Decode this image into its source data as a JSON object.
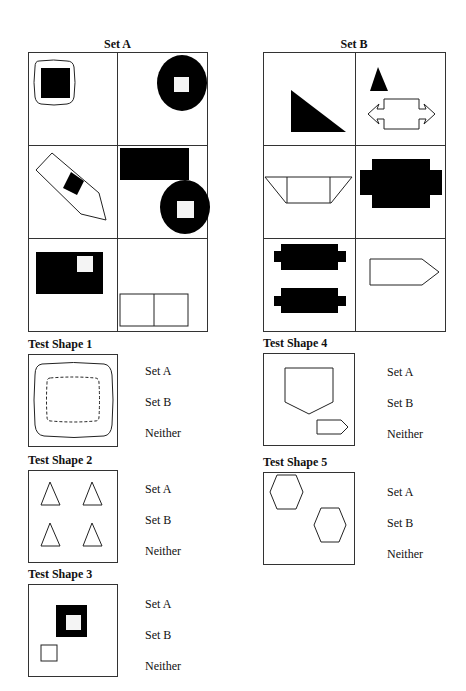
{
  "set_a": {
    "title": "Set A",
    "cells": [
      {
        "id": "a1",
        "desc": "black square inside rounded rectangle"
      },
      {
        "id": "a2",
        "desc": "black circle with white square"
      },
      {
        "id": "a3",
        "desc": "tilted pentagon with black diamond"
      },
      {
        "id": "a4",
        "desc": "black rectangle and black circle with white square"
      },
      {
        "id": "a5",
        "desc": "black rectangle with white square"
      },
      {
        "id": "a6",
        "desc": "two adjacent outlined squares"
      }
    ]
  },
  "set_b": {
    "title": "Set B",
    "cells": [
      {
        "id": "b1",
        "desc": "black right triangle"
      },
      {
        "id": "b2",
        "desc": "black triangle and outlined double arrow"
      },
      {
        "id": "b3",
        "desc": "outlined trapezoid"
      },
      {
        "id": "b4",
        "desc": "black stepped cross shape"
      },
      {
        "id": "b5",
        "desc": "two black stepped bars"
      },
      {
        "id": "b6",
        "desc": "outlined pentagon arrow"
      }
    ]
  },
  "tests": [
    {
      "label": "Test Shape 1",
      "options": [
        "Set A",
        "Set B",
        "Neither"
      ]
    },
    {
      "label": "Test Shape 2",
      "options": [
        "Set A",
        "Set B",
        "Neither"
      ]
    },
    {
      "label": "Test Shape 3",
      "options": [
        "Set A",
        "Set B",
        "Neither"
      ]
    },
    {
      "label": "Test Shape 4",
      "options": [
        "Set A",
        "Set B",
        "Neither"
      ]
    },
    {
      "label": "Test Shape 5",
      "options": [
        "Set A",
        "Set B",
        "Neither"
      ]
    }
  ]
}
